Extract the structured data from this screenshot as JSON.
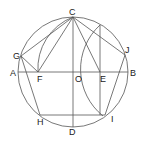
{
  "diagram": {
    "type": "geometric-construction",
    "circle": {
      "center": "O",
      "cx": 73,
      "cy": 72,
      "r": 55
    },
    "points": {
      "A": {
        "x": 18,
        "y": 72,
        "label": "A"
      },
      "B": {
        "x": 128,
        "y": 72,
        "label": "B"
      },
      "C": {
        "x": 73,
        "y": 17,
        "label": "C"
      },
      "D": {
        "x": 73,
        "y": 127,
        "label": "D"
      },
      "O": {
        "x": 73,
        "y": 72,
        "label": "O"
      },
      "E": {
        "x": 100,
        "y": 72,
        "label": "E"
      },
      "F": {
        "x": 38,
        "y": 72,
        "label": "F"
      },
      "G": {
        "x": 21,
        "y": 56,
        "label": "G"
      },
      "J": {
        "x": 125,
        "y": 55,
        "label": "J"
      },
      "H": {
        "x": 40,
        "y": 115,
        "label": "H"
      },
      "I": {
        "x": 105,
        "y": 115,
        "label": "I"
      }
    },
    "segments": [
      [
        "A",
        "B"
      ],
      [
        "C",
        "D"
      ],
      [
        "C",
        "G"
      ],
      [
        "C",
        "F"
      ],
      [
        "G",
        "F"
      ],
      [
        "C",
        "J"
      ],
      [
        "C",
        "E"
      ],
      [
        "G",
        "H"
      ],
      [
        "H",
        "I"
      ],
      [
        "J",
        "I"
      ],
      [
        "E",
        "top"
      ]
    ]
  }
}
